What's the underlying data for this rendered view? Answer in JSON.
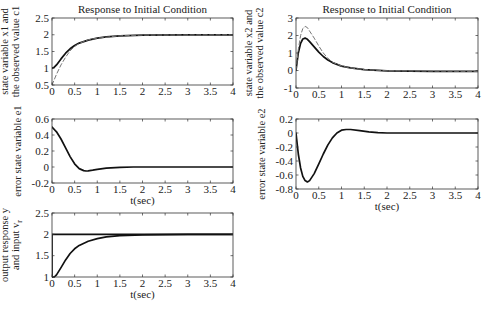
{
  "chart_data": [
    {
      "type": "line",
      "panel": "top-left",
      "title": "Response to Initial Condition",
      "xlabel": "",
      "ylabel": [
        "state variable x1 and",
        "the observed value c1"
      ],
      "xlim": [
        0,
        4
      ],
      "ylim": [
        0.5,
        2.5
      ],
      "xticks": [
        "0",
        "0.5",
        "1",
        "1.5",
        "2",
        "2.5",
        "3",
        "3.5",
        "4"
      ],
      "yticks": [
        "0.5",
        "1",
        "1.5",
        "2",
        "2.5"
      ],
      "series": [
        {
          "name": "x1",
          "style": "solid",
          "x": [
            0,
            0.05,
            0.1,
            0.2,
            0.3,
            0.4,
            0.5,
            0.6,
            0.8,
            1.0,
            1.2,
            1.5,
            2,
            3,
            4
          ],
          "y": [
            1.0,
            1.03,
            1.1,
            1.28,
            1.45,
            1.58,
            1.68,
            1.75,
            1.84,
            1.9,
            1.94,
            1.97,
            1.99,
            2.0,
            2.0
          ]
        },
        {
          "name": "c1",
          "style": "dashed",
          "x": [
            0,
            0.1,
            0.2,
            0.3,
            0.4,
            0.5,
            0.6,
            0.8,
            1.0,
            1.5,
            2,
            4
          ],
          "y": [
            0.5,
            0.82,
            1.1,
            1.33,
            1.52,
            1.65,
            1.74,
            1.85,
            1.9,
            1.97,
            1.99,
            2.0
          ]
        }
      ]
    },
    {
      "type": "line",
      "panel": "top-right",
      "title": "Response to Initial Condition",
      "xlabel": "",
      "ylabel": [
        "state variable x2 and",
        "the observed value c2"
      ],
      "xlim": [
        0,
        4
      ],
      "ylim": [
        -1,
        3
      ],
      "xticks": [
        "0",
        "0.5",
        "1",
        "1.5",
        "2",
        "2.5",
        "3",
        "3.5",
        "4"
      ],
      "yticks": [
        "-1",
        "0",
        "1",
        "2",
        "3"
      ],
      "series": [
        {
          "name": "x2",
          "style": "solid",
          "x": [
            0,
            0.05,
            0.1,
            0.15,
            0.2,
            0.25,
            0.3,
            0.4,
            0.5,
            0.6,
            0.7,
            0.8,
            1.0,
            1.2,
            1.5,
            2,
            2.5,
            3,
            4
          ],
          "y": [
            0,
            1.0,
            1.55,
            1.8,
            1.85,
            1.78,
            1.65,
            1.35,
            1.05,
            0.8,
            0.6,
            0.45,
            0.25,
            0.15,
            0.05,
            -0.02,
            -0.04,
            -0.05,
            -0.05
          ]
        },
        {
          "name": "c2",
          "style": "dashed",
          "x": [
            0,
            0.05,
            0.1,
            0.15,
            0.2,
            0.25,
            0.3,
            0.4,
            0.5,
            0.6,
            0.7,
            0.8,
            1.0,
            1.2,
            1.5,
            2,
            4
          ],
          "y": [
            0,
            1.2,
            2.0,
            2.4,
            2.52,
            2.45,
            2.25,
            1.85,
            1.4,
            1.0,
            0.7,
            0.48,
            0.25,
            0.15,
            0.05,
            -0.02,
            -0.05
          ]
        }
      ]
    },
    {
      "type": "line",
      "panel": "middle-left",
      "title": "",
      "xlabel": "t(sec)",
      "ylabel": [
        "error state variable e1"
      ],
      "xlim": [
        0,
        4
      ],
      "ylim": [
        -0.2,
        0.6
      ],
      "xticks": [
        "0",
        "0.5",
        "1",
        "1.5",
        "2",
        "2.5",
        "3",
        "3.5",
        "4"
      ],
      "yticks": [
        "-0.2",
        "0",
        "0.2",
        "0.4",
        "0.6"
      ],
      "series": [
        {
          "name": "e1",
          "style": "solid",
          "x": [
            0,
            0.1,
            0.2,
            0.3,
            0.4,
            0.5,
            0.6,
            0.7,
            0.75,
            0.8,
            0.9,
            1.0,
            1.2,
            1.5,
            1.8,
            2,
            4
          ],
          "y": [
            0.5,
            0.44,
            0.35,
            0.24,
            0.13,
            0.04,
            -0.02,
            -0.045,
            -0.05,
            -0.048,
            -0.04,
            -0.03,
            -0.015,
            -0.005,
            0,
            0,
            0
          ]
        }
      ]
    },
    {
      "type": "line",
      "panel": "middle-right",
      "title": "",
      "xlabel": "t(sec)",
      "ylabel": [
        "error state variable e2"
      ],
      "xlim": [
        0,
        4
      ],
      "ylim": [
        -0.8,
        0.2
      ],
      "xticks": [
        "0",
        "0.5",
        "1",
        "1.5",
        "2",
        "2.5",
        "3",
        "3.5",
        "4"
      ],
      "yticks": [
        "-0.8",
        "-0.6",
        "-0.4",
        "-0.2",
        "0",
        "0.2"
      ],
      "series": [
        {
          "name": "e2",
          "style": "solid",
          "x": [
            0,
            0.05,
            0.1,
            0.15,
            0.2,
            0.25,
            0.3,
            0.4,
            0.5,
            0.6,
            0.7,
            0.8,
            0.9,
            1.0,
            1.1,
            1.2,
            1.4,
            1.6,
            1.8,
            2,
            4
          ],
          "y": [
            0,
            -0.3,
            -0.5,
            -0.62,
            -0.68,
            -0.7,
            -0.68,
            -0.58,
            -0.44,
            -0.3,
            -0.17,
            -0.07,
            0.0,
            0.04,
            0.05,
            0.05,
            0.035,
            0.015,
            0.005,
            0,
            0
          ]
        }
      ]
    },
    {
      "type": "line",
      "panel": "bottom-left",
      "title": "",
      "xlabel": "t(sec)",
      "ylabel": [
        "output response y",
        "and input v_r"
      ],
      "xlim": [
        0,
        4
      ],
      "ylim": [
        1,
        2.5
      ],
      "xticks": [
        "0",
        "0.5",
        "1",
        "1.5",
        "2",
        "2.5",
        "3",
        "3.5",
        "4"
      ],
      "yticks": [
        "1",
        "1.5",
        "2",
        "2.5"
      ],
      "series": [
        {
          "name": "y",
          "style": "solid",
          "x": [
            0,
            0.05,
            0.1,
            0.2,
            0.3,
            0.4,
            0.5,
            0.6,
            0.8,
            1.0,
            1.2,
            1.5,
            2,
            3,
            4
          ],
          "y": [
            1.0,
            1.0,
            1.05,
            1.22,
            1.4,
            1.55,
            1.66,
            1.74,
            1.84,
            1.9,
            1.94,
            1.97,
            1.99,
            2.0,
            2.0
          ]
        },
        {
          "name": "v_r",
          "style": "solid",
          "x": [
            0,
            0,
            4
          ],
          "y": [
            1.0,
            2.0,
            2.0
          ]
        }
      ]
    }
  ],
  "panels": {
    "p1": {
      "title": "Response to Initial Condition",
      "ylabel1": "state variable x1 and",
      "ylabel2": "the observed value c1"
    },
    "p2": {
      "title": "Response to Initial Condition",
      "ylabel1": "state variable x2 and",
      "ylabel2": "the observed value c2"
    },
    "p3": {
      "ylabel1": "error state variable e1",
      "xlabel": "t(sec)"
    },
    "p4": {
      "ylabel1": "error state variable e2",
      "xlabel": "t(sec)"
    },
    "p5": {
      "ylabel1": "output response y",
      "ylabel2": "and input v",
      "ylabel2_sub": "r",
      "xlabel": "t(sec)"
    }
  }
}
